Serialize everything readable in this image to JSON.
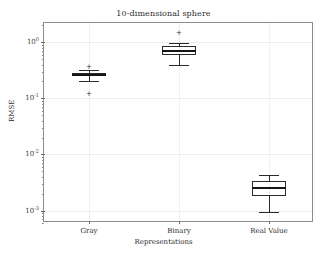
{
  "chart_data": {
    "type": "box",
    "title": "10-dimensional sphere",
    "xlabel": "Representations",
    "ylabel": "RMSE",
    "categories": [
      "Gray",
      "Binary",
      "Real Value"
    ],
    "yscale": "log",
    "ylim": [
      0.0006,
      2.2
    ],
    "grid": true,
    "legend": null,
    "ytick_labels": [
      "10",
      "10",
      "10",
      "10"
    ],
    "ytick_exponents": [
      "0",
      "-1",
      "-2",
      "-3"
    ],
    "ytick_values": [
      1,
      0.1,
      0.01,
      0.001
    ],
    "series": [
      {
        "name": "Gray",
        "whisker_low": 0.205,
        "q1": 0.245,
        "median": 0.262,
        "q3": 0.283,
        "whisker_high": 0.325,
        "fliers": [
          0.355,
          0.118
        ]
      },
      {
        "name": "Binary",
        "whisker_low": 0.385,
        "q1": 0.6,
        "median": 0.7,
        "q3": 0.855,
        "whisker_high": 0.95,
        "fliers": [
          1.45
        ]
      },
      {
        "name": "Real Value",
        "whisker_low": 0.00096,
        "q1": 0.00185,
        "median": 0.0025,
        "q3": 0.0033,
        "whisker_high": 0.0043,
        "fliers": []
      }
    ]
  },
  "style": {
    "axis_color": "#8d8d8d",
    "grid_color": "#ececed",
    "box_color": "#2a2a2a",
    "text_color": "#2b2b2b"
  },
  "flier_marker": "+"
}
